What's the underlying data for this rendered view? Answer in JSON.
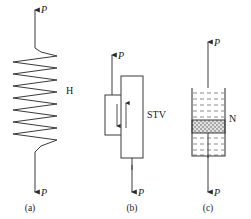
{
  "figure": {
    "stroke_color": "#3a3a3a",
    "text_color": "#1a1a1a",
    "background": "#ffffff"
  },
  "panels": [
    {
      "id": "a",
      "caption": "(a)",
      "element_label": "H",
      "element_type": "spring",
      "force_top": "P",
      "force_bottom": "P",
      "coil_count": 8
    },
    {
      "id": "b",
      "caption": "(b)",
      "element_label": "STV",
      "element_type": "slider",
      "force_top": "P",
      "force_bottom": "P",
      "inner_arrow_down": "down-arrow",
      "inner_arrow_up": "up-arrow"
    },
    {
      "id": "c",
      "caption": "(c)",
      "element_label": "N",
      "element_type": "dashpot",
      "force_top": "P",
      "force_bottom": "P",
      "fluid_line_count": 9,
      "piston_pattern": "stippled"
    }
  ]
}
